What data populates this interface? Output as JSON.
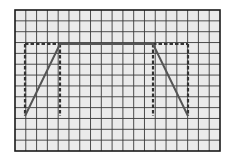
{
  "diagram": {
    "grid": {
      "columns": 19,
      "rows": 13,
      "left": 15,
      "top": 10,
      "width": 205,
      "height": 141,
      "background": "#ebebeb",
      "line_color": "#3a3a3a",
      "border_color": "#1a1a1a"
    },
    "trapezoid": {
      "points": [
        [
          25,
          116
        ],
        [
          60,
          44
        ],
        [
          153,
          44
        ],
        [
          188,
          116
        ]
      ],
      "stroke": "#555555",
      "style": "solid"
    },
    "dashed_lines": [
      {
        "name": "outer-top-left",
        "x1": 25,
        "y1": 44,
        "x2": 60,
        "y2": 44
      },
      {
        "name": "outer-top-right",
        "x1": 153,
        "y1": 44,
        "x2": 188,
        "y2": 44
      },
      {
        "name": "left-side",
        "x1": 25,
        "y1": 44,
        "x2": 25,
        "y2": 116
      },
      {
        "name": "right-side",
        "x1": 188,
        "y1": 44,
        "x2": 188,
        "y2": 116
      },
      {
        "name": "inner-left",
        "x1": 60,
        "y1": 44,
        "x2": 60,
        "y2": 116
      },
      {
        "name": "inner-right",
        "x1": 153,
        "y1": 44,
        "x2": 153,
        "y2": 116
      }
    ],
    "dashed_stroke": "#333333"
  }
}
